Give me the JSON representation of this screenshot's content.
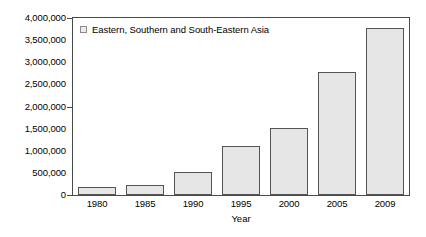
{
  "chart_data": {
    "type": "bar",
    "title": "",
    "subtitle": "",
    "xlabel": "Year",
    "ylabel": "",
    "categories": [
      "1980",
      "1985",
      "1990",
      "1995",
      "2000",
      "2005",
      "2009"
    ],
    "values": [
      180000,
      230000,
      520000,
      1110000,
      1510000,
      2780000,
      3780000
    ],
    "series": [
      {
        "name": "Eastern, Southern and South-Eastern Asia",
        "values": [
          180000,
          230000,
          520000,
          1110000,
          1510000,
          2780000,
          3780000
        ]
      }
    ],
    "ylim": [
      0,
      4000000
    ],
    "ytick_values": [
      0,
      500000,
      1000000,
      1500000,
      2000000,
      2500000,
      3000000,
      3500000,
      4000000
    ],
    "ytick_labels": [
      "0",
      "500,000",
      "1,000,000",
      "1,500,000",
      "2,000,000",
      "2,500,000",
      "3,000,000",
      "3,500,000",
      "4,000,000"
    ],
    "grid": false,
    "legend": {
      "position": "top-left",
      "entries": [
        {
          "label": "Eastern, Southern and South-Eastern Asia",
          "swatch_color": "#ececec",
          "swatch_border": "#8a8a8a"
        }
      ]
    },
    "colors": {
      "bar_fill": "#e6e6e6",
      "bar_border": "#555555",
      "axis": "#4a4a4a",
      "text": "#000000",
      "background": "#ffffff"
    }
  }
}
